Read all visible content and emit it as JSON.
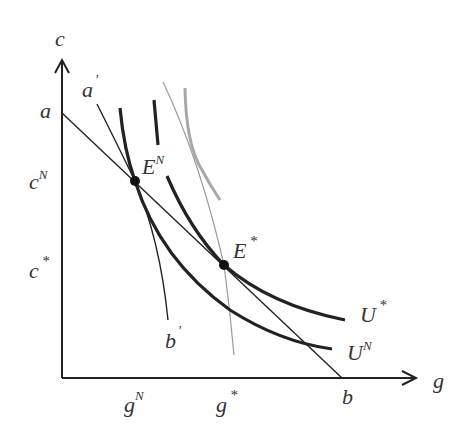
{
  "diagram": {
    "type": "economics-indifference-budget",
    "axes": {
      "y_label": "c",
      "x_label": "g"
    },
    "y_ticks": [
      {
        "base": "a",
        "sup": ""
      },
      {
        "base": "c",
        "sup": "N"
      },
      {
        "base": "c",
        "sup": "*"
      }
    ],
    "x_ticks": [
      {
        "base": "g",
        "sup": "N"
      },
      {
        "base": "g",
        "sup": "*"
      },
      {
        "base": "b",
        "sup": ""
      }
    ],
    "lines": {
      "budget_start": "a",
      "budget_end": "b",
      "alt_budget_start": {
        "base": "a",
        "sup": "'"
      },
      "alt_budget_end": {
        "base": "b",
        "sup": "'"
      }
    },
    "points": [
      {
        "base": "E",
        "sup": "N"
      },
      {
        "base": "E",
        "sup": "*"
      }
    ],
    "curves": [
      {
        "base": "U",
        "sup": "*"
      },
      {
        "base": "U",
        "sup": "N"
      }
    ],
    "colors": {
      "ink": "#222222",
      "text": "#333333",
      "gray_line": "#9a9a9a",
      "gray_curve": "#a8a8a8"
    }
  }
}
